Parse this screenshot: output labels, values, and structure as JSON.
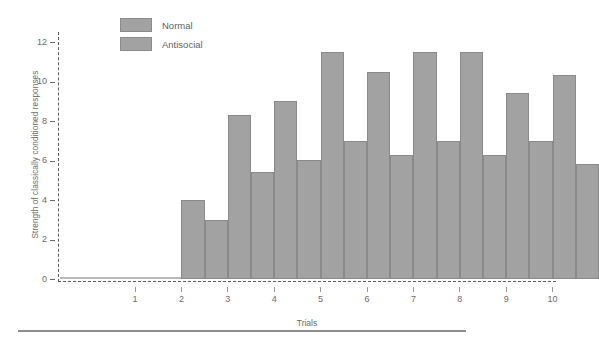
{
  "chart_data": {
    "type": "bar",
    "title": "",
    "xlabel": "Trials",
    "ylabel": "Strength of classically conditioned responses",
    "categories": [
      "1",
      "2",
      "3",
      "4",
      "5",
      "6",
      "7",
      "8",
      "9",
      "10"
    ],
    "series": [
      {
        "name": "Normal",
        "values": [
          0,
          4.0,
          8.3,
          9.0,
          11.5,
          10.5,
          11.5,
          11.5,
          9.4,
          10.3
        ]
      },
      {
        "name": "Antisocial",
        "values": [
          0,
          3.0,
          5.4,
          6.0,
          7.0,
          6.3,
          7.0,
          6.3,
          7.0,
          5.8
        ]
      }
    ],
    "ylim": [
      0,
      12.45
    ],
    "yticks": [
      0,
      2,
      4,
      6,
      8,
      10,
      12
    ],
    "ytick_labels": [
      "0",
      "2",
      "4",
      "6",
      "8",
      "10",
      "12"
    ],
    "xtick_labels": [
      "1",
      "2",
      "3",
      "4",
      "5",
      "6",
      "7",
      "8",
      "9",
      "10"
    ],
    "grid": false,
    "legend_position": "top-left-inside",
    "colors": {
      "bar_fill": "#a2a2a2",
      "bar_border": "#8a8a8a",
      "axis": "#5d5d5d",
      "text": "#6b6b6b",
      "background": "#ffffff"
    },
    "axis_style": "dashed"
  },
  "legend": {
    "items": [
      {
        "label": "Normal"
      },
      {
        "label": "Antisocial"
      }
    ]
  },
  "axes": {
    "y_title": "Strength of classically conditioned responses",
    "x_title": "Trials"
  }
}
